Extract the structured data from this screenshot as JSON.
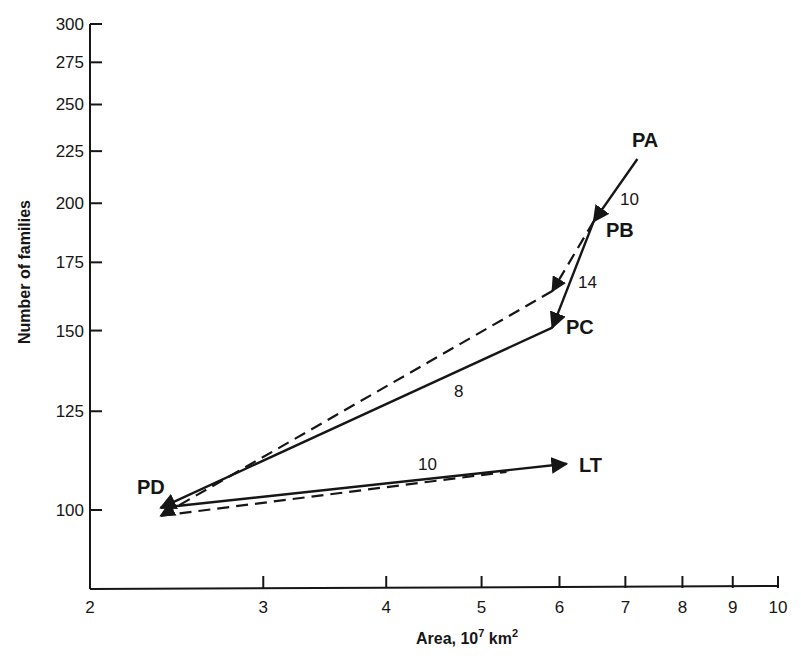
{
  "chart_data": {
    "type": "line",
    "title": "",
    "xlabel": "Area, 10^7 km^2",
    "xlabel_parts": {
      "main": "Area,  10",
      "sup1": "7",
      "mid": " km",
      "sup2": "2"
    },
    "ylabel": "Number of families",
    "xscale": "log",
    "yscale": "log",
    "xlim": [
      2,
      10
    ],
    "ylim": [
      100,
      300
    ],
    "x_ticks": [
      2,
      3,
      4,
      5,
      6,
      7,
      8,
      9,
      10
    ],
    "y_ticks": [
      100,
      125,
      150,
      175,
      200,
      225,
      250,
      275,
      300
    ],
    "grid": false,
    "legend": null,
    "points": [
      {
        "name": "PA",
        "x": 7.2,
        "y": 221
      },
      {
        "name": "PB",
        "x": 6.5,
        "y": 192
      },
      {
        "name": "PC",
        "x": 5.9,
        "y": 151
      },
      {
        "name": "PD",
        "x": 2.36,
        "y": 100
      },
      {
        "name": "LT",
        "x": 6.1,
        "y": 111
      }
    ],
    "series": [
      {
        "name": "solid path",
        "style": "solid",
        "x": [
          7.2,
          6.5,
          5.9,
          2.36,
          6.1
        ],
        "y": [
          221,
          192,
          151,
          100.5,
          111
        ],
        "labels": [
          "PA",
          "PB",
          "PC",
          "PD",
          "LT"
        ],
        "segment_labels": [
          {
            "from": "PA",
            "to": "PB",
            "text": "10"
          },
          {
            "from": "PC",
            "to": "PD",
            "text": "8"
          },
          {
            "from": "PD",
            "to": "LT",
            "text": "10"
          }
        ]
      },
      {
        "name": "dashed path",
        "style": "dashed",
        "x": [
          6.5,
          5.9,
          2.36,
          5.3
        ],
        "y": [
          192,
          164,
          98.7,
          109
        ],
        "segment_labels": [
          {
            "from": "PB",
            "to": "dashed-end",
            "text": "14"
          }
        ]
      }
    ]
  },
  "labels": {
    "points": {
      "PA": "PA",
      "PB": "PB",
      "PC": "PC",
      "PD": "PD",
      "LT": "LT"
    },
    "segments": {
      "pa_pb": "10",
      "pb_dash": "14",
      "pc_pd": "8",
      "pd_lt": "10"
    }
  }
}
